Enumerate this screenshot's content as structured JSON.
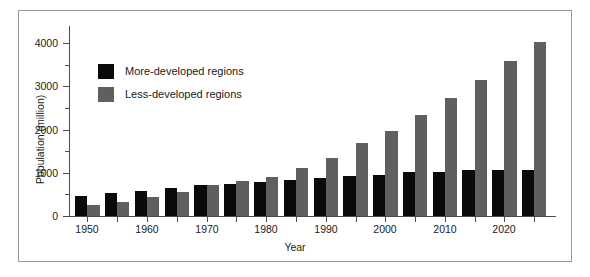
{
  "chart_data": {
    "type": "bar",
    "title": "",
    "xlabel": "Year",
    "ylabel": "Population (million)",
    "ylim": [
      0,
      4400
    ],
    "xlim": [
      1947.5,
      2027.5
    ],
    "grid": false,
    "legend_position": "upper-left-inside",
    "y_major_ticks": [
      0,
      1000,
      2000,
      3000,
      4000
    ],
    "y_minor_ticks": [
      500,
      1500,
      2500,
      3500
    ],
    "y_tick_labels": [
      "0",
      "1000",
      "2000",
      "3000",
      "4000"
    ],
    "x_tick_values": [
      1950,
      1955,
      1960,
      1965,
      1970,
      1975,
      1980,
      1985,
      1990,
      1995,
      2000,
      2005,
      2010,
      2015,
      2020,
      2025
    ],
    "x_tick_labels": [
      "1950",
      "",
      "1960",
      "",
      "1970",
      "",
      "1980",
      "",
      "1990",
      "",
      "2000",
      "",
      "2010",
      "",
      "2020",
      ""
    ],
    "x_labeled_values": [
      1950,
      1960,
      1970,
      1980,
      1990,
      2000,
      2010,
      2020
    ],
    "categories": [
      "1950",
      "1955",
      "1960",
      "1965",
      "1970",
      "1975",
      "1980",
      "1985",
      "1990",
      "1995",
      "2000",
      "2005",
      "2010",
      "2015",
      "2020",
      "2025"
    ],
    "series": [
      {
        "name": "More-developed regions",
        "color": "#0a0a0a",
        "values": [
          470,
          540,
          580,
          660,
          710,
          750,
          780,
          830,
          890,
          930,
          960,
          1020,
          1010,
          1060,
          1060,
          1060
        ]
      },
      {
        "name": "Less-developed regions",
        "color": "#5f5f5f",
        "values": [
          260,
          330,
          450,
          550,
          720,
          800,
          910,
          1120,
          1350,
          1700,
          1960,
          2330,
          2730,
          3160,
          3600,
          4040
        ]
      }
    ]
  },
  "legend": {
    "items": [
      {
        "label": "More-developed regions",
        "color": "#0a0a0a"
      },
      {
        "label": "Less-developed regions",
        "color": "#5f5f5f"
      }
    ]
  },
  "axes": {
    "x_title": "Year",
    "y_title": "Population (million)"
  }
}
